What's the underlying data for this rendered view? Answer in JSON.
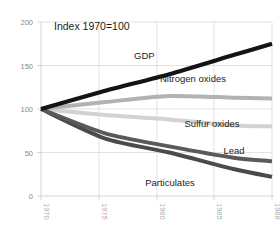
{
  "chart_data": {
    "type": "line",
    "title": "Index 1970=100",
    "xlabel": "",
    "ylabel": "",
    "xlim": [
      1970,
      1988
    ],
    "ylim": [
      0,
      200
    ],
    "yticks": [
      0,
      50,
      100,
      150,
      200
    ],
    "xticks": [
      1970,
      1975,
      1980,
      1985,
      1988
    ],
    "grid": true,
    "legend_position": "inline-right",
    "x": [
      1970,
      1975,
      1980,
      1985,
      1988
    ],
    "series": [
      {
        "name": "GDP",
        "label": "GDP",
        "color": "#141414",
        "width": 4.2,
        "values": [
          100,
          121,
          140,
          162,
          175
        ]
      },
      {
        "name": "Nitrogen oxides",
        "label": "Nitrogen oxides",
        "color": "#b2b2b2",
        "width": 4.0,
        "values": [
          100,
          108,
          115,
          113,
          112
        ]
      },
      {
        "name": "Sulfur oxides",
        "label": "Sulfur oxides",
        "color": "#d2d2d2",
        "width": 4.0,
        "values": [
          100,
          93,
          88,
          81,
          80
        ]
      },
      {
        "name": "Lead",
        "label": "Lead",
        "color": "#5a5a5a",
        "width": 4.0,
        "values": [
          100,
          72,
          57,
          44,
          40
        ]
      },
      {
        "name": "Particulates",
        "label": "Particulates",
        "color": "#4a4a4a",
        "width": 4.0,
        "values": [
          100,
          66,
          50,
          31,
          22
        ]
      }
    ]
  },
  "axis": {
    "ytick_labels": [
      "200",
      "150",
      "100",
      "50",
      "0"
    ],
    "xtick_labels": [
      "1970",
      "1975",
      "1980",
      "1985",
      "1988"
    ]
  },
  "labels": {
    "title": "Index 1970=100",
    "gdp": "GDP",
    "nitrogen_oxides": "Nitrogen oxides",
    "sulfur_oxides": "Sulfur oxides",
    "lead": "Lead",
    "particulates": "Particulates"
  }
}
